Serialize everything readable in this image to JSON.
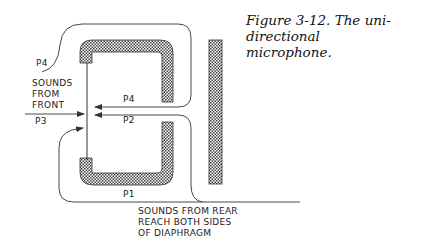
{
  "caption": {
    "line1": "Figure 3-12. The uni-directional",
    "line2": "microphone."
  },
  "labels": {
    "p4_top": "P4",
    "sounds_front_1": "SOUNDS",
    "sounds_front_2": "FROM",
    "sounds_front_3": "FRONT",
    "p4_arrow": "P4",
    "p3": "P3",
    "p2": "P2",
    "p1": "P1",
    "rear_1": "SOUNDS FROM REAR",
    "rear_2": "REACH BOTH SIDES",
    "rear_3": "OF DIAPHRAGM"
  },
  "colors": {
    "line": "#333333",
    "hatch": "#555555",
    "background": "#ffffff"
  }
}
